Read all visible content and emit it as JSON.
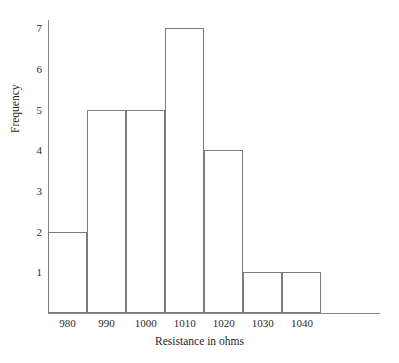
{
  "chart_data": {
    "type": "bar",
    "title": "",
    "subtitle": "",
    "xlabel": "Resistance in ohms",
    "ylabel": "Frequency",
    "categories": [
      "980",
      "990",
      "1000",
      "1010",
      "1020",
      "1030",
      "1040"
    ],
    "values": [
      2,
      5,
      5,
      7,
      4,
      1,
      1
    ],
    "bin_edges": [
      975,
      985,
      995,
      1005,
      1015,
      1025,
      1035,
      1045
    ],
    "bin_width": 10,
    "xlim": [
      975,
      1060
    ],
    "ylim": [
      0,
      7.2
    ],
    "ytick_labels": [
      "1",
      "2",
      "3",
      "4",
      "5",
      "6",
      "7"
    ],
    "ytick_values": [
      1,
      2,
      3,
      4,
      5,
      6,
      7
    ],
    "grid": false,
    "legend": null,
    "bar_fill": "#ffffff",
    "bar_stroke": "#7c7c7c",
    "axis_color": "#8a8a8a",
    "background": "#ffffff",
    "annotations": []
  }
}
